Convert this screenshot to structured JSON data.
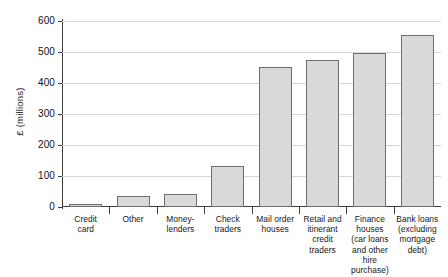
{
  "chart_data": {
    "type": "bar",
    "title": "",
    "subtitle": "",
    "xlabel": "",
    "ylabel": "£ (millions)",
    "ylim": [
      0,
      600
    ],
    "yticks": [
      0,
      100,
      200,
      300,
      400,
      500,
      600
    ],
    "ytick_labels": [
      "0",
      "100",
      "200",
      "300",
      "400",
      "500",
      "600"
    ],
    "grid": "horizontal",
    "legend": "none",
    "categories": [
      "Credit card",
      "Other",
      "Money-lenders",
      "Check traders",
      "Mail order houses",
      "Retail and itinerant credit traders",
      "Finance houses (car loans and other hire purchase)",
      "Bank loans (excluding mortgage debt)"
    ],
    "category_label_lines": [
      [
        "Credit",
        "card"
      ],
      [
        "Other"
      ],
      [
        "Money-",
        "lenders"
      ],
      [
        "Check",
        "traders"
      ],
      [
        "Mail order",
        "houses"
      ],
      [
        "Retail and",
        "itinerant",
        "credit traders"
      ],
      [
        "Finance",
        "houses",
        "(car loans",
        "and other",
        "hire purchase)"
      ],
      [
        "Bank loans",
        "(excluding",
        "mortgage",
        "debt)"
      ]
    ],
    "values": [
      5,
      35,
      42,
      132,
      452,
      473,
      498,
      555
    ],
    "bar_fill_color": "#d9d9d9",
    "bar_border_color": "#6e6e6e",
    "gridline_color": "#d6d6d6",
    "axis_color": "#3c3c3c",
    "background_color": "#ffffff"
  }
}
